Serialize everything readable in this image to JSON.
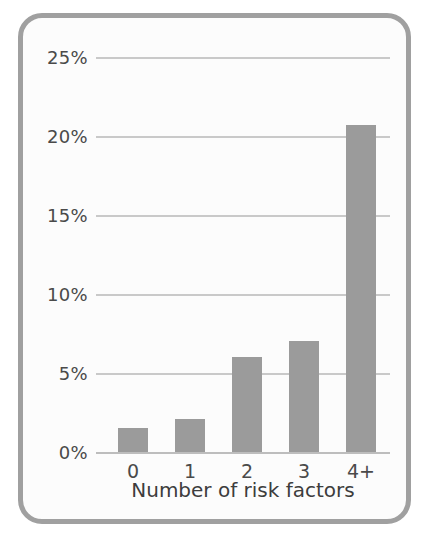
{
  "chart_data": {
    "type": "bar",
    "title": "",
    "subtitle": "",
    "xlabel": "Number of risk factors",
    "ylabel": "",
    "categories": [
      "0",
      "1",
      "2",
      "3",
      "4+"
    ],
    "values": [
      1.5,
      2.1,
      6.0,
      7.0,
      20.7
    ],
    "value_unit": "percent",
    "ylim": [
      0,
      25
    ],
    "ytick_values": [
      0,
      5,
      10,
      15,
      20,
      25
    ],
    "ytick_labels": [
      "0%",
      "5%",
      "10%",
      "15%",
      "20%",
      "25%"
    ],
    "xtick_labels": [
      "0",
      "1",
      "2",
      "3",
      "4+"
    ],
    "grid": "horizontal",
    "legend": "none",
    "series": [
      {
        "name": "Prevalence",
        "values": [
          1.5,
          2.1,
          6.0,
          7.0,
          20.7
        ]
      }
    ],
    "colors": {
      "bar_fill": "#9b9b9b",
      "gridline": "#c9c9c9",
      "axis_baseline": "#bdbdbd",
      "tick_text": "#4a4a4a",
      "axis_title_text": "#3d3d3d",
      "frame_border": "#a0a0a0",
      "plot_background": "#fcfcfc",
      "page_background": "#ffffff"
    }
  }
}
